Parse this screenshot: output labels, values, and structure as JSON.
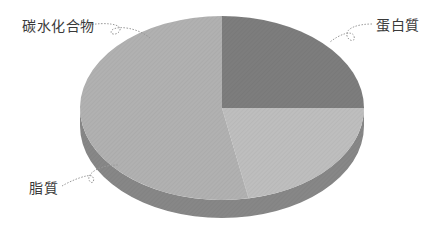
{
  "chart_data": {
    "type": "pie",
    "style": "3d",
    "title": "",
    "categories": [
      "蛋白質",
      "碳水化合物",
      "脂質"
    ],
    "values": [
      25,
      22,
      53
    ],
    "unit": "%",
    "colors": {
      "蛋白質": "#7d7d7d",
      "碳水化合物": "#bebebe",
      "脂質": "#b1b1b1",
      "side": "#878787"
    },
    "legend": "none (callout labels)",
    "labels": [
      {
        "text": "碳水化合物",
        "position": "top-left"
      },
      {
        "text": "蛋白質",
        "position": "top-right"
      },
      {
        "text": "脂質",
        "position": "bottom-left"
      }
    ]
  },
  "labels": {
    "carb": "碳水化合物",
    "protein": "蛋白質",
    "lipid": "脂質"
  }
}
